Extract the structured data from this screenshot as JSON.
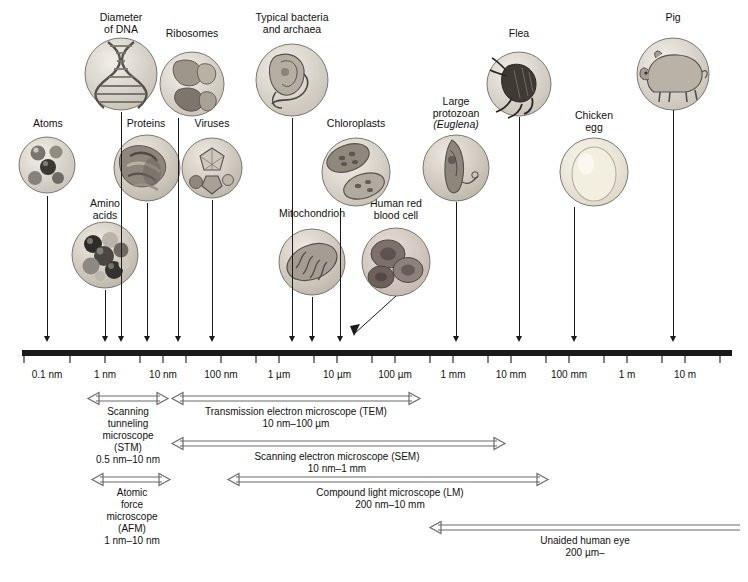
{
  "figure": {
    "axis": {
      "ticks": [
        "0.1 nm",
        "1 nm",
        "10 nm",
        "100 nm",
        "1 µm",
        "10 µm",
        "100 µm",
        "1 mm",
        "10 mm",
        "100 mm",
        "1 m",
        "10 m"
      ],
      "tick_x": [
        47,
        105,
        163,
        221,
        279,
        337,
        395,
        453,
        511,
        569,
        627,
        685
      ]
    },
    "specimens": [
      {
        "name": "atoms",
        "label": "Atoms",
        "label_x": 20,
        "label_y": 118,
        "label_w": 56,
        "circle_cx": 47,
        "circle_cy": 165,
        "r": 28,
        "pointer_x": 47,
        "pointer_top": 196,
        "pointer_bottom": 342
      },
      {
        "name": "amino-acids",
        "label": "Amino\nacids",
        "label_x": 74,
        "label_y": 198,
        "label_w": 62,
        "circle_cx": 105,
        "circle_cy": 255,
        "r": 33,
        "pointer_x": 105,
        "pointer_top": 290,
        "pointer_bottom": 342
      },
      {
        "name": "diameter-of-dna",
        "label": "Diameter\nof DNA",
        "label_x": 86,
        "label_y": 12,
        "label_w": 70,
        "circle_cx": 121,
        "circle_cy": 74,
        "r": 36,
        "pointer_x": 121,
        "pointer_top": 112,
        "pointer_bottom": 342
      },
      {
        "name": "proteins",
        "label": "Proteins",
        "label_x": 116,
        "label_y": 118,
        "label_w": 60,
        "circle_cx": 147,
        "circle_cy": 168,
        "r": 33,
        "pointer_x": 147,
        "pointer_top": 203,
        "pointer_bottom": 342
      },
      {
        "name": "ribosomes",
        "label": "Ribosomes",
        "label_x": 155,
        "label_y": 28,
        "label_w": 74,
        "circle_cx": 192,
        "circle_cy": 84,
        "r": 32,
        "pointer_x": 178,
        "pointer_top": 118,
        "pointer_bottom": 342
      },
      {
        "name": "viruses",
        "label": "Viruses",
        "label_x": 183,
        "label_y": 118,
        "label_w": 58,
        "circle_cx": 212,
        "circle_cy": 168,
        "r": 30,
        "pointer_x": 212,
        "pointer_top": 200,
        "pointer_bottom": 342
      },
      {
        "name": "typical-bacteria-and-archaea",
        "label": "Typical bacteria\nand archaea",
        "label_x": 244,
        "label_y": 12,
        "label_w": 96,
        "circle_cx": 292,
        "circle_cy": 80,
        "r": 36,
        "pointer_x": 292,
        "pointer_top": 118,
        "pointer_bottom": 342
      },
      {
        "name": "mitochondrion",
        "label": "Mitochondrion",
        "label_x": 268,
        "label_y": 208,
        "label_w": 88,
        "circle_cx": 312,
        "circle_cy": 262,
        "r": 33,
        "pointer_x": 312,
        "pointer_top": 297,
        "pointer_bottom": 342
      },
      {
        "name": "chloroplasts",
        "label": "Chloroplasts",
        "label_x": 316,
        "label_y": 118,
        "label_w": 80,
        "circle_cx": 356,
        "circle_cy": 172,
        "r": 34,
        "pointer_x": 340,
        "pointer_top": 208,
        "pointer_bottom": 342
      },
      {
        "name": "human-red-blood-cell",
        "label": "Human red\nblood cell",
        "label_x": 358,
        "label_y": 198,
        "label_w": 76,
        "circle_cx": 396,
        "circle_cy": 262,
        "r": 34,
        "pointer_x": 396,
        "pointer_top": 296,
        "pointer_bottom": 342
      },
      {
        "name": "large-protozoan-euglena",
        "label": "Large\nprotozoan",
        "label_x": 420,
        "label_y": 96,
        "label_w": 72,
        "label2": "(Euglena)",
        "circle_cx": 456,
        "circle_cy": 168,
        "r": 33,
        "pointer_x": 456,
        "pointer_top": 202,
        "pointer_bottom": 342
      },
      {
        "name": "flea",
        "label": "Flea",
        "label_x": 497,
        "label_y": 28,
        "label_w": 44,
        "circle_cx": 519,
        "circle_cy": 84,
        "r": 32,
        "pointer_x": 519,
        "pointer_top": 117,
        "pointer_bottom": 342
      },
      {
        "name": "chicken-egg",
        "label": "Chicken\negg",
        "label_x": 562,
        "label_y": 110,
        "label_w": 64,
        "circle_cx": 594,
        "circle_cy": 172,
        "r": 34,
        "pointer_x": 574,
        "pointer_top": 207,
        "pointer_bottom": 342
      },
      {
        "name": "pig",
        "label": "Pig",
        "label_x": 653,
        "label_y": 12,
        "label_w": 40,
        "circle_cx": 673,
        "circle_cy": 74,
        "r": 36,
        "pointer_x": 673,
        "pointer_top": 110,
        "pointer_bottom": 342
      }
    ],
    "methods": [
      {
        "name": "stm",
        "label": "Scanning\ntunneling\nmicroscope\n(STM)\n0.5 nm–10 nm",
        "bar_left": 88,
        "bar_right": 168,
        "bar_y": 396,
        "label_x": 78,
        "label_y": 405,
        "label_w": 100
      },
      {
        "name": "tem",
        "label": "Transmission electron microscope (TEM)\n10 nm–100 µm",
        "bar_left": 172,
        "bar_right": 420,
        "bar_y": 396,
        "label_x": 186,
        "label_y": 402,
        "label_w": 220
      },
      {
        "name": "sem",
        "label": "Scanning electron microscope (SEM)\n10 nm–1 mm",
        "bar_left": 172,
        "bar_right": 505,
        "bar_y": 441,
        "label_x": 222,
        "label_y": 448,
        "label_w": 230
      },
      {
        "name": "afm",
        "label": "Atomic\nforce\nmicroscope\n(AFM)\n1 nm–10 nm",
        "bar_left": 92,
        "bar_right": 170,
        "bar_y": 477,
        "label_x": 82,
        "label_y": 484,
        "label_w": 100
      },
      {
        "name": "lm",
        "label": "Compound light microscope (LM)\n200 nm–10 mm",
        "bar_left": 228,
        "bar_right": 548,
        "bar_y": 477,
        "label_x": 265,
        "label_y": 484,
        "label_w": 250
      },
      {
        "name": "unaided-eye",
        "label": "Unaided human eye\n200 µm–",
        "bar_left": 430,
        "bar_right": 740,
        "bar_y": 525,
        "label_x": 500,
        "label_y": 533,
        "label_w": 170
      }
    ]
  }
}
